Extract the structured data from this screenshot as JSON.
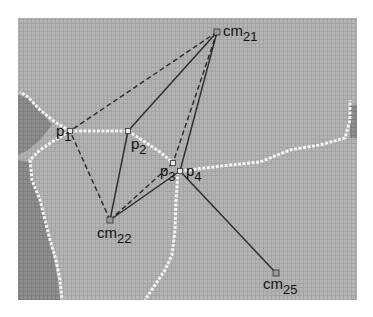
{
  "figure": {
    "background": "#ffffff",
    "grid_fill": "#a9a9a9",
    "dark_fill": "#8a8a8a",
    "boundary_color": "#f2f2f2",
    "line_color": "#2a2a2a",
    "region": {
      "x": 18,
      "y": 18,
      "w": 339,
      "h": 282
    }
  },
  "points": [
    {
      "id": "cm21",
      "kind": "centroid",
      "label": "cm",
      "sub": "21",
      "x": 217,
      "y": 32,
      "lx": 223,
      "ly": 23
    },
    {
      "id": "p1",
      "kind": "vertex",
      "label": "p",
      "sub": "1",
      "x": 70,
      "y": 131,
      "lx": 56,
      "ly": 123
    },
    {
      "id": "p2",
      "kind": "vertex",
      "label": "p",
      "sub": "2",
      "x": 128,
      "y": 131,
      "lx": 131,
      "ly": 136
    },
    {
      "id": "p3",
      "kind": "vertex",
      "label": "p",
      "sub": "3",
      "x": 173,
      "y": 163,
      "lx": 160,
      "ly": 163
    },
    {
      "id": "p4",
      "kind": "vertex",
      "label": "p",
      "sub": "4",
      "x": 180,
      "y": 171,
      "lx": 186,
      "ly": 163
    },
    {
      "id": "cm22",
      "kind": "centroid",
      "label": "cm",
      "sub": "22",
      "x": 110,
      "y": 220,
      "lx": 97,
      "ly": 225
    },
    {
      "id": "cm25",
      "kind": "centroid",
      "label": "cm",
      "sub": "25",
      "x": 276,
      "y": 273,
      "lx": 263,
      "ly": 276
    }
  ],
  "edges": [
    {
      "from": "cm21",
      "to": "p1",
      "style": "dashed"
    },
    {
      "from": "cm21",
      "to": "p2",
      "style": "solid"
    },
    {
      "from": "cm21",
      "to": "p3",
      "style": "dashed"
    },
    {
      "from": "cm21",
      "to": "p4",
      "style": "solid"
    },
    {
      "from": "cm22",
      "to": "p1",
      "style": "dashed"
    },
    {
      "from": "cm22",
      "to": "p2",
      "style": "solid"
    },
    {
      "from": "cm22",
      "to": "p3",
      "style": "dashed"
    },
    {
      "from": "cm22",
      "to": "p4",
      "style": "solid"
    },
    {
      "from": "p4",
      "to": "cm25",
      "style": "solid"
    }
  ],
  "boundaries": [
    {
      "name": "p1-p2-edge",
      "points": [
        [
          70,
          131
        ],
        [
          128,
          131
        ]
      ]
    },
    {
      "name": "p2-p3-edge",
      "points": [
        [
          128,
          131
        ],
        [
          145,
          142
        ],
        [
          160,
          152
        ],
        [
          173,
          163
        ]
      ]
    },
    {
      "name": "p4-right-edge",
      "points": [
        [
          180,
          171
        ],
        [
          230,
          165
        ],
        [
          260,
          162
        ],
        [
          290,
          150
        ],
        [
          320,
          145
        ],
        [
          345,
          138
        ],
        [
          350,
          120
        ],
        [
          350,
          100
        ]
      ]
    },
    {
      "name": "p1-upper-left-edge",
      "points": [
        [
          70,
          131
        ],
        [
          55,
          122
        ],
        [
          40,
          110
        ],
        [
          28,
          97
        ],
        [
          20,
          92
        ]
      ]
    },
    {
      "name": "p1-lower-left-edge",
      "points": [
        [
          70,
          131
        ],
        [
          55,
          140
        ],
        [
          40,
          150
        ],
        [
          30,
          160
        ],
        [
          32,
          180
        ],
        [
          40,
          200
        ],
        [
          45,
          220
        ],
        [
          50,
          240
        ],
        [
          56,
          260
        ],
        [
          60,
          280
        ],
        [
          62,
          300
        ]
      ]
    },
    {
      "name": "p3-lower-edge",
      "points": [
        [
          178,
          172
        ],
        [
          176,
          200
        ],
        [
          175,
          230
        ],
        [
          172,
          255
        ],
        [
          165,
          270
        ],
        [
          155,
          285
        ],
        [
          145,
          300
        ]
      ]
    }
  ],
  "dark_regions": [
    {
      "name": "left-dark-top",
      "points": [
        [
          18,
          95
        ],
        [
          28,
          98
        ],
        [
          40,
          110
        ],
        [
          52,
          125
        ],
        [
          40,
          140
        ],
        [
          28,
          150
        ],
        [
          18,
          155
        ]
      ]
    },
    {
      "name": "left-dark-bottom",
      "points": [
        [
          18,
          160
        ],
        [
          30,
          162
        ],
        [
          34,
          180
        ],
        [
          42,
          205
        ],
        [
          48,
          230
        ],
        [
          53,
          255
        ],
        [
          58,
          280
        ],
        [
          60,
          300
        ],
        [
          18,
          300
        ]
      ]
    },
    {
      "name": "right-dark",
      "points": [
        [
          350,
          105
        ],
        [
          357,
          105
        ],
        [
          357,
          138
        ],
        [
          350,
          138
        ]
      ]
    }
  ]
}
